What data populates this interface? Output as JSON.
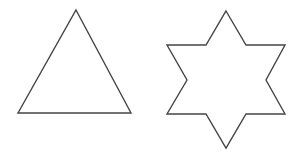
{
  "canvas": {
    "width": 300,
    "height": 157,
    "background_color": "#ffffff"
  },
  "style": {
    "stroke_color": "#454545",
    "stroke_width": "1.4"
  },
  "shapes": [
    {
      "name": "triangle",
      "description": "outlined upward-pointing triangle",
      "points": "76,10 131,113 18,113"
    },
    {
      "name": "six-pointed-star",
      "description": "outlined hexagram (six-pointed star)",
      "points": "226,11 246,45 285,45 266,80 285,114 246,114 226,148 206,114 167,114 187,80 167,45 206,45"
    }
  ]
}
